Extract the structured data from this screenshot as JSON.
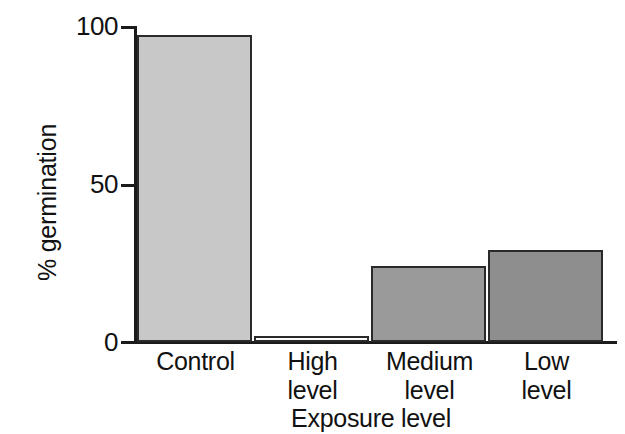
{
  "chart_data": {
    "type": "bar",
    "title": "",
    "xlabel": "Exposure level",
    "ylabel": "% germination",
    "categories": [
      "Control",
      "High level",
      "Medium level",
      "Low level"
    ],
    "category_lines": [
      [
        "Control",
        ""
      ],
      [
        "High",
        "level"
      ],
      [
        "Medium",
        "level"
      ],
      [
        "Low",
        "level"
      ]
    ],
    "values": [
      97,
      2,
      24,
      29
    ],
    "ylim": [
      0,
      100
    ],
    "yticks": [
      0,
      50,
      100
    ],
    "ytick_labels": [
      "0",
      "50",
      "100"
    ],
    "grid": false,
    "legend": "none",
    "bar_colors": [
      "#c8c8c8",
      "#fbfbfb",
      "#9a9a9a",
      "#8e8e8e"
    ],
    "bar_border_color": "#2a2a2a",
    "axis_color": "#1b1b1b",
    "background": "#ffffff"
  }
}
